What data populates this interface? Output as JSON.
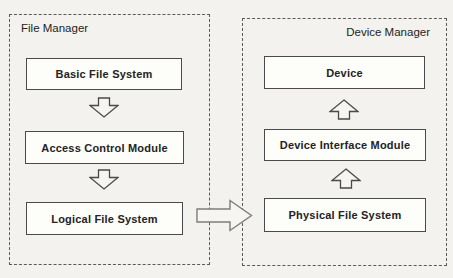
{
  "page": {
    "background": "#f3f2ee"
  },
  "colors": {
    "page_bg": "#f3f2ee",
    "container_border": "#5a5a5a",
    "box_border": "#4a4a4a",
    "box_fill": "#fdfdfa",
    "text": "#232323",
    "small_arrow_outline": "#4a4a4a",
    "connector_outline": "#7d7d7d",
    "arrow_fill": "#f6f5f1"
  },
  "file_manager": {
    "title": "File Manager",
    "boxes": [
      {
        "label": "Basic File System"
      },
      {
        "label": "Access Control Module"
      },
      {
        "label": "Logical File System"
      }
    ],
    "flow_direction": "down"
  },
  "device_manager": {
    "title": "Device Manager",
    "boxes": [
      {
        "label": "Device"
      },
      {
        "label": "Device Interface Module"
      },
      {
        "label": "Physical File System"
      }
    ],
    "flow_direction": "up"
  },
  "connector": {
    "from": "Logical File System",
    "to": "Physical File System",
    "direction": "right"
  }
}
